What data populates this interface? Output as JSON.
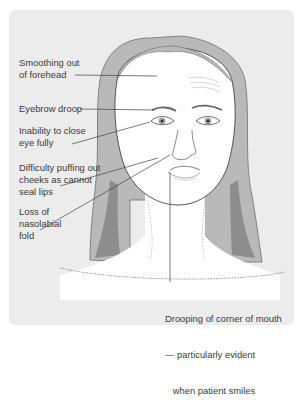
{
  "diagram": {
    "colors": {
      "background": "#ececec",
      "hair_fill": "#b9b9b9",
      "hair_dark": "#8d8d8d",
      "skin": "#ffffff",
      "line": "#444444",
      "text": "#3a3a3a"
    },
    "labels": [
      {
        "id": "forehead",
        "lines": [
          "Smoothing out",
          "of forehead"
        ]
      },
      {
        "id": "eyebrow",
        "lines": [
          "Eyebrow droop"
        ]
      },
      {
        "id": "eye",
        "lines": [
          "Inability to close",
          "eye fully"
        ]
      },
      {
        "id": "cheeks",
        "lines": [
          "Difficulty puffing out",
          "cheeks as cannot",
          "seal lips"
        ]
      },
      {
        "id": "nasolabial",
        "lines": [
          "Loss of",
          "nasolabial",
          "fold"
        ]
      },
      {
        "id": "mouth",
        "lines": [
          "Drooping of corner of mouth",
          "— particularly evident",
          "   when patient smiles"
        ]
      }
    ]
  }
}
